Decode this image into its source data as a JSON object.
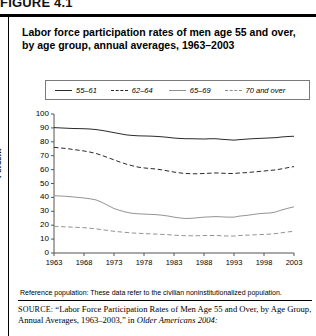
{
  "figure": {
    "label": "FIGURE 4.1",
    "title": "Labor force participation rates of men age 55 and over, by age group, annual averages, 1963–2003"
  },
  "notes": {
    "reference_population": "Reference population: These data refer to the civilian noninstitutionalized population.",
    "source_prefix": "SOURCE:",
    "source_body": "“Labor Force Participation Rates of Men Age 55 and Over, by Age Group, Annual Averages, 1963–2003,” in ",
    "source_italic": "Older Americans 2004:"
  },
  "chart_data": {
    "type": "line",
    "title": "Labor force participation rates of men age 55 and over, by age group, annual averages, 1963–2003",
    "xlabel": "",
    "ylabel": "Percent",
    "xlim": [
      1963,
      2003
    ],
    "ylim": [
      0,
      100
    ],
    "grid": false,
    "legend_position": "top",
    "y_ticks": [
      0,
      10,
      20,
      30,
      40,
      50,
      60,
      70,
      80,
      90,
      100
    ],
    "x_ticks": [
      1963,
      1968,
      1973,
      1978,
      1983,
      1988,
      1993,
      1998,
      2003
    ],
    "x": [
      1963,
      1964,
      1965,
      1966,
      1967,
      1968,
      1969,
      1970,
      1971,
      1972,
      1973,
      1974,
      1975,
      1976,
      1977,
      1978,
      1979,
      1980,
      1981,
      1982,
      1983,
      1984,
      1985,
      1986,
      1987,
      1988,
      1989,
      1990,
      1991,
      1992,
      1993,
      1994,
      1995,
      1996,
      1997,
      1998,
      1999,
      2000,
      2001,
      2002,
      2003
    ],
    "series": [
      {
        "name": "55–61",
        "style": "solid",
        "color": "#2b2b2b",
        "values": [
          90.2,
          90.0,
          89.8,
          89.6,
          89.5,
          89.4,
          89.2,
          88.8,
          88.2,
          87.4,
          86.6,
          85.8,
          85.0,
          84.6,
          84.3,
          84.2,
          84.1,
          83.9,
          83.6,
          83.2,
          82.7,
          82.4,
          82.2,
          82.2,
          82.1,
          82.0,
          82.2,
          82.2,
          81.8,
          81.5,
          81.2,
          81.6,
          81.9,
          82.2,
          82.4,
          82.6,
          82.8,
          83.0,
          83.5,
          83.8,
          84.0
        ]
      },
      {
        "name": "62–64",
        "style": "dashed",
        "color": "#2b2b2b",
        "values": [
          76.0,
          75.6,
          75.2,
          74.6,
          74.0,
          73.4,
          72.6,
          71.6,
          70.2,
          68.6,
          67.0,
          65.4,
          64.0,
          62.8,
          61.8,
          61.2,
          60.8,
          60.4,
          59.8,
          59.0,
          58.2,
          57.6,
          57.2,
          57.0,
          57.0,
          57.2,
          57.4,
          57.6,
          57.4,
          57.2,
          57.2,
          57.6,
          57.8,
          58.2,
          58.6,
          59.0,
          59.4,
          59.8,
          60.6,
          61.4,
          62.2
        ]
      },
      {
        "name": "65–69",
        "style": "solid",
        "color": "#8e8e8e",
        "values": [
          41.2,
          41.0,
          40.8,
          40.4,
          40.0,
          39.6,
          39.0,
          38.2,
          36.4,
          34.2,
          32.0,
          30.6,
          29.4,
          28.6,
          28.2,
          28.0,
          27.8,
          27.6,
          27.2,
          26.6,
          25.8,
          25.2,
          24.8,
          25.0,
          25.4,
          25.8,
          26.0,
          26.2,
          26.0,
          25.8,
          25.8,
          26.6,
          27.0,
          27.6,
          28.2,
          28.6,
          28.8,
          29.6,
          31.0,
          32.2,
          33.2
        ]
      },
      {
        "name": "70 and over",
        "style": "dashed",
        "color": "#8e8e8e",
        "values": [
          19.2,
          19.0,
          18.8,
          18.6,
          18.4,
          18.2,
          17.8,
          17.4,
          16.8,
          16.2,
          15.6,
          15.2,
          14.8,
          14.4,
          14.2,
          14.0,
          13.8,
          13.6,
          13.4,
          13.2,
          12.8,
          12.6,
          12.4,
          12.4,
          12.4,
          12.6,
          12.6,
          12.6,
          12.4,
          12.2,
          12.2,
          12.6,
          12.8,
          13.0,
          13.2,
          13.4,
          13.6,
          14.0,
          14.6,
          15.2,
          15.6
        ]
      }
    ]
  }
}
